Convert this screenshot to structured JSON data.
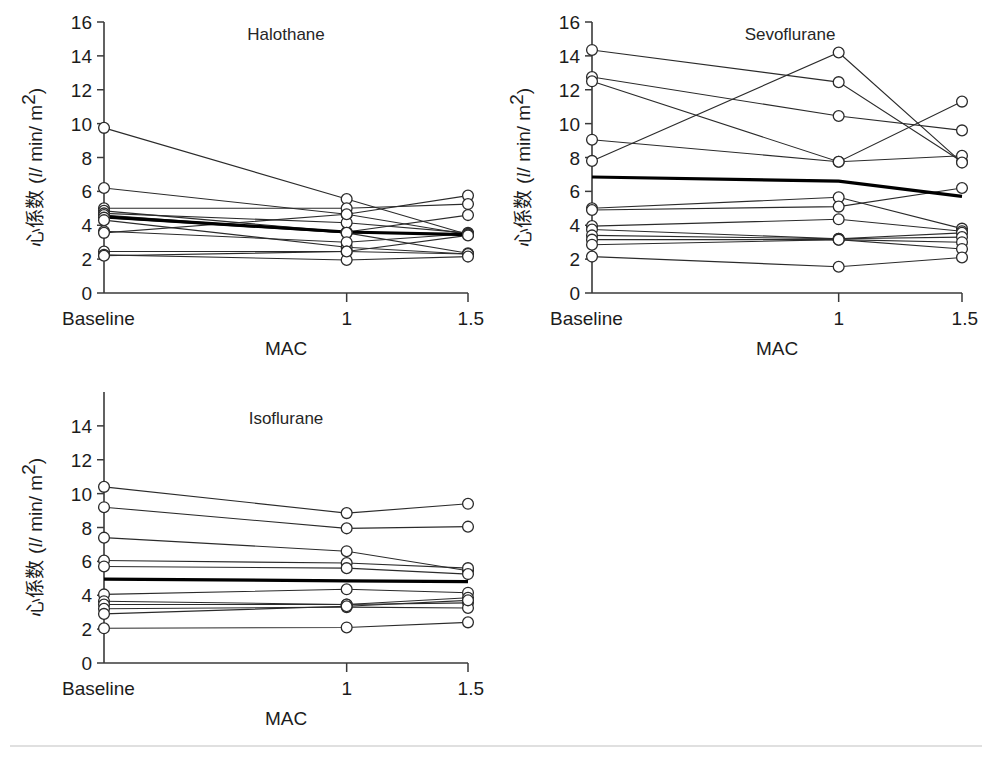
{
  "figure": {
    "width": 992,
    "height": 760,
    "background": "#ffffff",
    "line_color": "#2b2b2b",
    "mean_line_color": "#000000",
    "marker_fill": "#ffffff",
    "axis_color": "#3a3a3a",
    "footer_rule_color": "#d6d6d6"
  },
  "common": {
    "xlabel": "MAC",
    "ylabel_cjk": "心係数",
    "ylabel_unit_open": "(",
    "ylabel_unit_l": "l",
    "ylabel_unit_mid": "/ min/ m",
    "ylabel_unit_sup": "2",
    "ylabel_unit_close": ")",
    "ylabel_full": "心係数 (l/ min/ m2)",
    "categories": [
      "Baseline",
      "1",
      "1.5"
    ],
    "x_positions": [
      0,
      1,
      1.5
    ],
    "ylim": [
      0,
      16
    ],
    "ytick_step": 2,
    "grid": false,
    "legend": "none",
    "marker": "open-circle"
  },
  "chart_data": [
    {
      "id": "halothane",
      "type": "line",
      "title": "Halothane",
      "xlabel": "MAC",
      "ylabel": "心係数 (l/ min/ m2)",
      "categories": [
        "Baseline",
        "1",
        "1.5"
      ],
      "x": [
        0,
        1,
        1.5
      ],
      "ylim": [
        0,
        16
      ],
      "yticks": [
        0,
        2,
        4,
        6,
        8,
        10,
        12,
        14,
        16
      ],
      "ytick_labels": [
        "0",
        "2",
        "4",
        "6",
        "8",
        "10",
        "12",
        "14",
        "16"
      ],
      "series": [
        {
          "name": "s1",
          "values": [
            9.75,
            5.55,
            3.45
          ]
        },
        {
          "name": "s2",
          "values": [
            6.2,
            4.65,
            5.75
          ]
        },
        {
          "name": "s3",
          "values": [
            5.0,
            5.0,
            5.25
          ]
        },
        {
          "name": "s4",
          "values": [
            4.85,
            3.6,
            4.6
          ]
        },
        {
          "name": "s5",
          "values": [
            4.7,
            4.15,
            3.55
          ]
        },
        {
          "name": "s6",
          "values": [
            4.6,
            3.55,
            3.5
          ]
        },
        {
          "name": "s7",
          "values": [
            4.45,
            3.55,
            2.35
          ]
        },
        {
          "name": "s8",
          "values": [
            4.3,
            2.7,
            2.3
          ]
        },
        {
          "name": "s9",
          "values": [
            3.65,
            3.0,
            3.5
          ]
        },
        {
          "name": "s10",
          "values": [
            3.55,
            4.65,
            3.45
          ]
        },
        {
          "name": "s11",
          "values": [
            2.45,
            2.45,
            2.3
          ]
        },
        {
          "name": "s12",
          "values": [
            2.25,
            1.95,
            2.15
          ]
        },
        {
          "name": "s13",
          "values": [
            2.2,
            2.45,
            3.4
          ]
        }
      ],
      "mean_series": {
        "name": "mean",
        "values": [
          4.5,
          3.6,
          3.45
        ],
        "emphasis": "bold"
      }
    },
    {
      "id": "sevoflurane",
      "type": "line",
      "title": "Sevoflurane",
      "xlabel": "MAC",
      "ylabel": "心係数 (l/ min/ m2)",
      "categories": [
        "Baseline",
        "1",
        "1.5"
      ],
      "x": [
        0,
        1,
        1.5
      ],
      "ylim": [
        0,
        16
      ],
      "yticks": [
        0,
        2,
        4,
        6,
        8,
        10,
        12,
        14,
        16
      ],
      "ytick_labels": [
        "0",
        "2",
        "4",
        "6",
        "8",
        "10",
        "12",
        "14",
        "16"
      ],
      "series": [
        {
          "name": "s1",
          "values": [
            14.35,
            12.45,
            7.75
          ]
        },
        {
          "name": "s2",
          "values": [
            12.75,
            10.45,
            9.6
          ]
        },
        {
          "name": "s3",
          "values": [
            12.5,
            7.75,
            11.3
          ]
        },
        {
          "name": "s4",
          "values": [
            9.05,
            7.75,
            8.1
          ]
        },
        {
          "name": "s5",
          "values": [
            7.8,
            14.2,
            7.7
          ]
        },
        {
          "name": "s6",
          "values": [
            5.0,
            5.65,
            3.8
          ]
        },
        {
          "name": "s7",
          "values": [
            4.9,
            5.1,
            6.2
          ]
        },
        {
          "name": "s8",
          "values": [
            3.95,
            4.35,
            3.65
          ]
        },
        {
          "name": "s9",
          "values": [
            3.75,
            3.2,
            3.55
          ]
        },
        {
          "name": "s10",
          "values": [
            3.4,
            3.2,
            3.3
          ]
        },
        {
          "name": "s11",
          "values": [
            3.15,
            3.15,
            3.0
          ]
        },
        {
          "name": "s12",
          "values": [
            2.85,
            3.15,
            2.6
          ]
        },
        {
          "name": "s13",
          "values": [
            2.15,
            1.55,
            2.1
          ]
        }
      ],
      "mean_series": {
        "name": "mean",
        "values": [
          6.85,
          6.6,
          5.7
        ],
        "emphasis": "bold"
      }
    },
    {
      "id": "isoflurane",
      "type": "line",
      "title": "Isoflurane",
      "xlabel": "MAC",
      "ylabel": "心係数 (l/ min/ m2)",
      "categories": [
        "Baseline",
        "1",
        "1.5"
      ],
      "x": [
        0,
        1,
        1.5
      ],
      "ylim": [
        0,
        16
      ],
      "yticks": [
        0,
        2,
        4,
        6,
        8,
        10,
        12,
        14
      ],
      "ytick_labels": [
        "0",
        "2",
        "4",
        "6",
        "8",
        "10",
        "12",
        "14"
      ],
      "series": [
        {
          "name": "s1",
          "values": [
            10.4,
            8.85,
            9.4
          ]
        },
        {
          "name": "s2",
          "values": [
            9.2,
            7.95,
            8.05
          ]
        },
        {
          "name": "s3",
          "values": [
            7.4,
            6.6,
            5.45
          ]
        },
        {
          "name": "s4",
          "values": [
            6.05,
            5.9,
            5.6
          ]
        },
        {
          "name": "s5",
          "values": [
            5.7,
            5.6,
            5.25
          ]
        },
        {
          "name": "s6",
          "values": [
            4.05,
            4.35,
            4.15
          ]
        },
        {
          "name": "s7",
          "values": [
            3.65,
            3.45,
            3.85
          ]
        },
        {
          "name": "s8",
          "values": [
            3.45,
            3.45,
            3.55
          ]
        },
        {
          "name": "s9",
          "values": [
            3.2,
            3.3,
            3.25
          ]
        },
        {
          "name": "s10",
          "values": [
            2.9,
            3.35,
            3.7
          ]
        },
        {
          "name": "s11",
          "values": [
            2.05,
            2.1,
            2.4
          ]
        }
      ],
      "mean_series": {
        "name": "mean",
        "values": [
          4.95,
          4.85,
          4.8
        ],
        "emphasis": "bold"
      }
    }
  ],
  "panels_layout": [
    {
      "id": "halothane",
      "plot_x0": 104,
      "plot_x1": 468,
      "plot_y_top": 22,
      "plot_y_bottom": 293,
      "title_x": 286,
      "title_y": 40
    },
    {
      "id": "sevoflurane",
      "plot_x0": 592,
      "plot_x1": 962,
      "plot_y_top": 22,
      "plot_y_bottom": 293,
      "title_x": 790,
      "title_y": 40
    },
    {
      "id": "isoflurane",
      "plot_x0": 104,
      "plot_x1": 468,
      "plot_y_top": 392,
      "plot_y_bottom": 663,
      "title_x": 286,
      "title_y": 424
    }
  ],
  "footer": {
    "rule_y": 746
  }
}
